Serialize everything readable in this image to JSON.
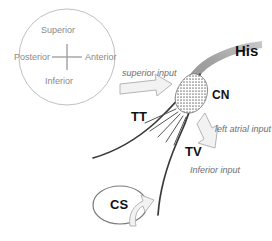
{
  "figure": {
    "background": "#ffffff"
  },
  "compass": {
    "name": "orientation-compass",
    "superior": "Superior",
    "inferior": "Inferior",
    "anterior": "Anterior",
    "posterior": "Posterior",
    "circle_color": "#b9b9b9",
    "text_color": "#8a8a8a",
    "cross_color": "#9a9a9a"
  },
  "structures": {
    "his": {
      "label": "His",
      "color": "#111111",
      "band_color": "#9b9b9b"
    },
    "cn": {
      "label": "CN",
      "color": "#111111",
      "fill": "#8c8c8c"
    },
    "tt": {
      "label": "TT",
      "color": "#111111"
    },
    "tv": {
      "label": "TV",
      "color": "#111111"
    },
    "cs": {
      "label": "CS",
      "color": "#111111",
      "outline": "#7a7a7a"
    }
  },
  "inputs": [
    {
      "label": "superior input",
      "direction": "right",
      "color": "#6e6e6e"
    },
    {
      "label": "left atrial input",
      "direction": "up-left",
      "color": "#6e6e6e"
    },
    {
      "label": "Inferior input",
      "direction": "up",
      "color": "#6e6e6e"
    }
  ],
  "colors": {
    "line": "#3a3a3a",
    "arrow_stroke": "#b0b0b0",
    "arrow_fill": "#f2f2f2",
    "fan": "#555555"
  }
}
